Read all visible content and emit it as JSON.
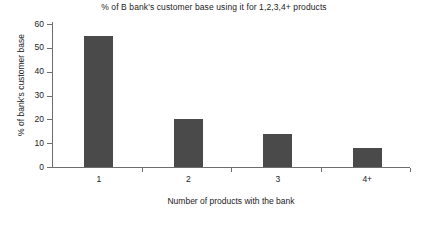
{
  "chart_data": {
    "type": "bar",
    "title": "% of B bank's customer base using it for 1,2,3,4+ products",
    "xlabel": "Number of products with the bank",
    "ylabel": "% of bank's customer base",
    "categories": [
      "1",
      "2",
      "3",
      "4+"
    ],
    "values": [
      55,
      20,
      14,
      8
    ],
    "ylim": [
      0,
      60
    ],
    "ytick_labels": [
      "0",
      "10",
      "20",
      "30",
      "40",
      "50",
      "60"
    ],
    "ytick_values": [
      0,
      10,
      20,
      30,
      40,
      50,
      60
    ],
    "grid": false,
    "legend": "none",
    "series": [
      {
        "name": "% of bank's customer base",
        "values": [
          55,
          20,
          14,
          8
        ],
        "color": "#4a4a4a"
      }
    ],
    "colors": {
      "bar": "#4a4a4a",
      "axis": "#6d6d6d",
      "text": "#1c1c1c",
      "background": "#ffffff"
    }
  }
}
